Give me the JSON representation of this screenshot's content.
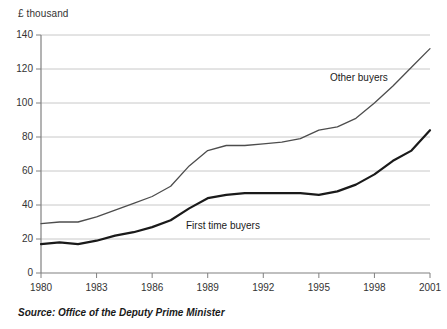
{
  "axis_unit_label": "£ thousand",
  "source_note": "Source: Office of the Deputy Prime Minister",
  "annotations": {
    "other_buyers": "Other buyers",
    "first_time_buyers": "First time buyers"
  },
  "colors": {
    "other_buyers_line": "#4d4d4d",
    "first_time_buyers_line": "#1a1a1a",
    "gridline": "#c8c8c8",
    "axis": "#808080",
    "text": "#333333",
    "background": "#ffffff"
  },
  "chart_data": {
    "type": "line",
    "title": "",
    "subtitle": "",
    "xlabel": "",
    "ylabel": "£ thousand",
    "xlim": [
      1980,
      2001
    ],
    "ylim": [
      0,
      140
    ],
    "ytick_values": [
      0,
      20,
      40,
      60,
      80,
      100,
      120,
      140
    ],
    "ytick_labels": [
      "0",
      "20",
      "40",
      "60",
      "80",
      "100",
      "120",
      "140"
    ],
    "xtick_values": [
      1980,
      1983,
      1986,
      1989,
      1992,
      1995,
      1998,
      2001
    ],
    "xtick_labels": [
      "1980",
      "1983",
      "1986",
      "1989",
      "1992",
      "1995",
      "1998",
      "2001"
    ],
    "grid": "horizontal",
    "legend": "inline-annotations",
    "x": [
      1980,
      1981,
      1982,
      1983,
      1984,
      1985,
      1986,
      1987,
      1988,
      1989,
      1990,
      1991,
      1992,
      1993,
      1994,
      1995,
      1996,
      1997,
      1998,
      1999,
      2000,
      2001
    ],
    "series": [
      {
        "name": "Other buyers",
        "values": [
          29,
          30,
          30,
          33,
          37,
          41,
          45,
          51,
          63,
          72,
          75,
          75,
          76,
          77,
          79,
          84,
          86,
          91,
          100,
          110,
          121,
          132
        ]
      },
      {
        "name": "First time buyers",
        "values": [
          17,
          18,
          17,
          19,
          22,
          24,
          27,
          31,
          38,
          44,
          46,
          47,
          47,
          47,
          47,
          46,
          48,
          52,
          58,
          66,
          72,
          84
        ]
      }
    ]
  }
}
